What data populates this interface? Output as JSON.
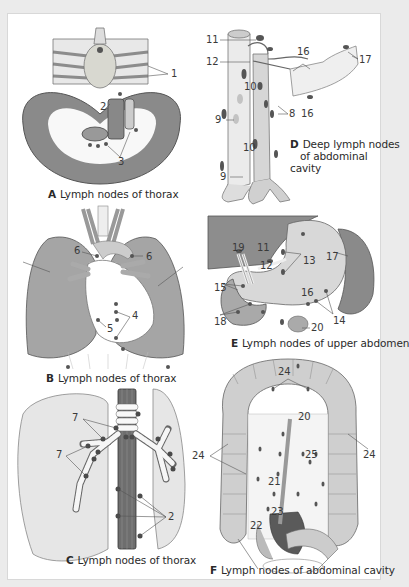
{
  "figure": {
    "background": "#ebebeb",
    "card_color": "#ffffff",
    "node_color": "#555555",
    "panels": [
      {
        "id": "A",
        "letter": "A",
        "caption": "Lymph nodes of thorax",
        "labels": [
          "1",
          "2",
          "3"
        ]
      },
      {
        "id": "B",
        "letter": "B",
        "caption": "Lymph nodes of thorax",
        "labels": [
          "6",
          "6",
          "4",
          "5"
        ]
      },
      {
        "id": "C",
        "letter": "C",
        "caption": "Lymph nodes of thorax",
        "labels": [
          "7",
          "7",
          "2"
        ]
      },
      {
        "id": "D",
        "letter": "D",
        "caption_line1": "Deep lymph nodes",
        "caption_line2": "of abdominal cavity",
        "labels": [
          "11",
          "12",
          "16",
          "17",
          "10",
          "9",
          "8",
          "16",
          "10",
          "9"
        ]
      },
      {
        "id": "E",
        "letter": "E",
        "caption": "Lymph nodes of upper abdomen",
        "labels": [
          "19",
          "11",
          "12",
          "13",
          "17",
          "15",
          "16",
          "18",
          "20",
          "14"
        ]
      },
      {
        "id": "F",
        "letter": "F",
        "caption": "Lymph nodes of abdominal cavity",
        "labels": [
          "24",
          "20",
          "24",
          "24",
          "25",
          "21",
          "22",
          "23"
        ]
      }
    ]
  }
}
